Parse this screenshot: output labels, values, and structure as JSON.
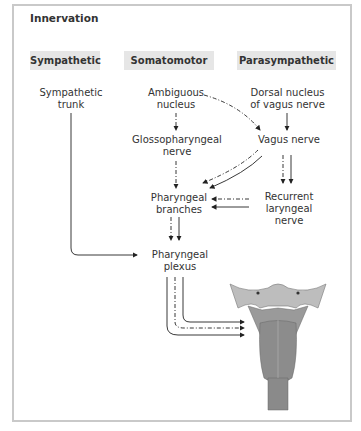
{
  "title": "Innervation",
  "headers": [
    "Sympathetic",
    "Somatomotor",
    "Parasympathetic"
  ],
  "nodes": {
    "sympathetic_trunk": "Sympathetic trunk",
    "ambiguous_nucleus": "Ambiguous nucleus",
    "dorsal_nucleus": "Dorsal nucleus of vagus nerve",
    "glossopharyngeal": "Glossopharyngeal nerve",
    "vagus": "Vagus nerve",
    "pharyngeal_branches": "Pharyngeal branches",
    "recurrent_laryngeal": "Recurrent laryngeal nerve",
    "pharyngeal_plexus": "Pharyngeal plexus"
  },
  "legend_styles": {
    "solid": "solid line",
    "dashdot": "dash-dot line"
  },
  "illustration": "pharyngeal-muscles-posterior-view",
  "colors": {
    "header_bg": "#e6e6e6",
    "frame": "#c9c9c9",
    "line": "#222222",
    "muscle": "#8a8a8a"
  }
}
